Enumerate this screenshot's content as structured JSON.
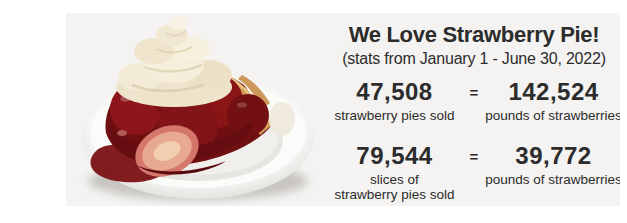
{
  "colors": {
    "page_background": "#ffffff",
    "banner_background": "#f4f3f1",
    "text": "#2c2c2c",
    "strawberry_red": "#7c1114",
    "cream": "#f1e8d2",
    "crust_gold": "#d29a57",
    "plate_white": "#fbfbfa"
  },
  "banner": {
    "title": "We Love Strawberry Pie!",
    "subtitle": "(stats from January 1 - June 30, 2022)",
    "stats": {
      "row1": {
        "pies_value": "47,508",
        "pies_caption": "strawberry pies sold",
        "equals": "=",
        "pounds_value": "142,524",
        "pounds_caption": "pounds of strawberries"
      },
      "row2": {
        "slices_value": "79,544",
        "slices_caption_line1": "slices of",
        "slices_caption_line2": "strawberry pies sold",
        "equals": "=",
        "pounds_value": "39,772",
        "pounds_caption": "pounds of strawberries"
      }
    }
  },
  "photo": {
    "description": "Slice of strawberry pie topped with a whipped cream swirl on a white plate"
  }
}
